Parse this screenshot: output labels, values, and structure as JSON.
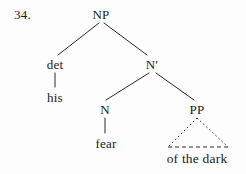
{
  "example": {
    "number_label": "34."
  },
  "colors": {
    "ink": "#1c1c1c",
    "background": "#fdfdfd"
  },
  "tree": {
    "type": "syntax-tree",
    "nodes": [
      {
        "id": "np",
        "label": "NP",
        "kind": "phrase",
        "x": 101,
        "y": 14
      },
      {
        "id": "det",
        "label": "det",
        "kind": "category",
        "x": 55,
        "y": 64
      },
      {
        "id": "his",
        "label": "his",
        "kind": "word",
        "x": 55,
        "y": 97
      },
      {
        "id": "nbar",
        "label": "N′",
        "kind": "phrase",
        "x": 152,
        "y": 64
      },
      {
        "id": "n",
        "label": "N",
        "kind": "category",
        "x": 105,
        "y": 109
      },
      {
        "id": "fear",
        "label": "fear",
        "kind": "word",
        "x": 106,
        "y": 143
      },
      {
        "id": "pp",
        "label": "PP",
        "kind": "phrase",
        "x": 197,
        "y": 109
      },
      {
        "id": "ofthedark",
        "label": "of the dark",
        "kind": "word-string",
        "x": 197,
        "y": 158
      }
    ],
    "edges": [
      {
        "from": "np",
        "to": "det",
        "style": "solid"
      },
      {
        "from": "np",
        "to": "nbar",
        "style": "solid"
      },
      {
        "from": "det",
        "to": "his",
        "style": "solid"
      },
      {
        "from": "nbar",
        "to": "n",
        "style": "solid"
      },
      {
        "from": "nbar",
        "to": "pp",
        "style": "solid"
      },
      {
        "from": "n",
        "to": "fear",
        "style": "solid"
      },
      {
        "from": "pp",
        "to": "ofthedark",
        "style": "dotted-triangle"
      }
    ]
  }
}
